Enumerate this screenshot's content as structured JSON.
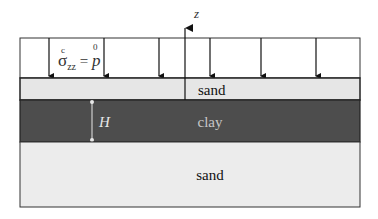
{
  "diagram": {
    "axis": {
      "label": "z"
    },
    "load": {
      "label_sigma": "σ",
      "label_sup_c": "c",
      "label_sub": "zz",
      "label_eq": " = ",
      "label_p": "p",
      "label_sup_0": "0",
      "arrow_x": [
        49,
        104,
        159,
        210,
        261,
        316
      ]
    },
    "layers": [
      {
        "name": "sand",
        "label": "sand",
        "fill": "#e6e6e6",
        "text_color": "#111111"
      },
      {
        "name": "clay",
        "label": "clay",
        "fill": "#4d4d4d",
        "text_color": "#c8c8c8"
      },
      {
        "name": "sand-bottom",
        "label": "sand",
        "fill": "#ececec",
        "text_color": "#111111"
      }
    ],
    "dimension": {
      "label": "H",
      "color": "#e8e8e8"
    }
  }
}
